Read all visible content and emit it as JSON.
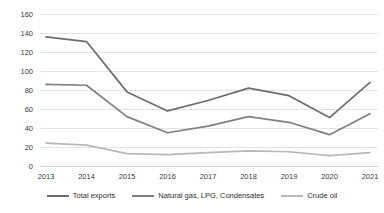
{
  "chart_data": {
    "type": "line",
    "title": "",
    "xlabel": "",
    "ylabel": "",
    "categories": [
      "2013",
      "2014",
      "2015",
      "2016",
      "2017",
      "2018",
      "2019",
      "2020",
      "2021"
    ],
    "ylim": [
      0,
      160
    ],
    "yticks": [
      0,
      20,
      40,
      60,
      80,
      100,
      120,
      140,
      160
    ],
    "grid": true,
    "legend_position": "bottom",
    "series": [
      {
        "name": "Total exports",
        "color": "#6d6d6d",
        "values": [
          136,
          131,
          78,
          58,
          69,
          82,
          74,
          51,
          88
        ]
      },
      {
        "name": "Natural gas, LPG, Condensates",
        "color": "#808080",
        "values": [
          86,
          85,
          52,
          35,
          42,
          52,
          46,
          33,
          55
        ]
      },
      {
        "name": "Crude oil",
        "color": "#b8b8b8",
        "values": [
          24,
          22,
          13,
          12,
          14,
          16,
          15,
          11,
          14
        ]
      }
    ]
  },
  "legend": {
    "items": [
      {
        "label": "Total exports"
      },
      {
        "label": "Natural gas, LPG, Condensates"
      },
      {
        "label": "Crude oil"
      }
    ]
  }
}
